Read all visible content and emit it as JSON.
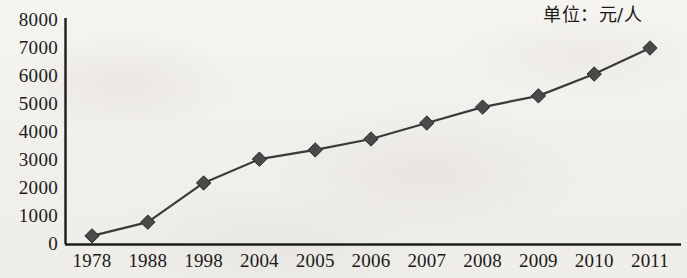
{
  "chart_data": {
    "type": "line",
    "title": "",
    "subtitle": "",
    "annotation": "单位：元/人",
    "xlabel": "",
    "ylabel": "",
    "categories": [
      "1978",
      "1988",
      "1998",
      "2004",
      "2005",
      "2006",
      "2007",
      "2008",
      "2009",
      "2010",
      "2011"
    ],
    "values": [
      290,
      780,
      2180,
      3030,
      3360,
      3750,
      4320,
      4890,
      5290,
      6070,
      7000
    ],
    "series": [
      {
        "name": "",
        "values": [
          290,
          780,
          2180,
          3030,
          3360,
          3750,
          4320,
          4890,
          5290,
          6070,
          7000
        ]
      }
    ],
    "ylim": [
      0,
      8000
    ],
    "ytick_labels": [
      "0",
      "1000",
      "2000",
      "3000",
      "4000",
      "5000",
      "6000",
      "7000",
      "8000"
    ],
    "ytick_values": [
      0,
      1000,
      2000,
      3000,
      4000,
      5000,
      6000,
      7000,
      8000
    ],
    "xtick_labels": [
      "1978",
      "1988",
      "1998",
      "2004",
      "2005",
      "2006",
      "2007",
      "2008",
      "2009",
      "2010",
      "2011"
    ],
    "grid": false,
    "legend": false,
    "legend_position": "none",
    "marker": "diamond",
    "marker_color": "#4a4a4a",
    "line_color": "#3a3a3a"
  }
}
